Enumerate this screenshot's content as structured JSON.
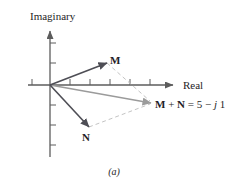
{
  "diagram": {
    "axis_labels": {
      "imaginary": "Imaginary",
      "real": "Real"
    },
    "vector_labels": {
      "m": "M",
      "n": "N"
    },
    "sum_label": {
      "m": "M",
      "plus": " + ",
      "n": "N",
      "eq": " = 5 − ",
      "j": "j",
      "imag": "1"
    },
    "caption": "(a)",
    "colors": {
      "bg": "#ffffff",
      "axis": "#5c5c5c",
      "vector": "#4e4e55",
      "sum-vector": "#9b9b9b",
      "dashed": "#c4c4c4",
      "text": "#1e1e26"
    }
  }
}
